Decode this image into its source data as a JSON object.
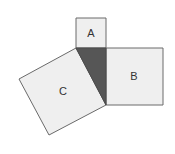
{
  "diagram": {
    "colors": {
      "background": "#ffffff",
      "square_fill": "#efefef",
      "stroke": "#6a6a6a",
      "triangle_fill": "#565656",
      "label": "#333333"
    },
    "triangle": {
      "points": "76,48 106,48 106,105"
    },
    "squares": [
      {
        "id": "A",
        "label": "A",
        "points": "76,18 106,18 106,48 76,48",
        "label_x": 91,
        "label_y": 37
      },
      {
        "id": "B",
        "label": "B",
        "points": "106,48 163,48 163,105 106,105",
        "label_x": 134,
        "label_y": 80
      },
      {
        "id": "C",
        "label": "C",
        "points": "76,48 106,105 49,135 19,79",
        "label_x": 63,
        "label_y": 95
      }
    ]
  }
}
